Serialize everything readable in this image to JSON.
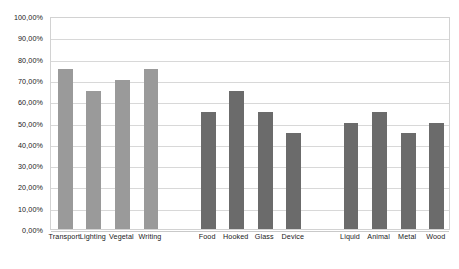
{
  "chart_data": {
    "type": "bar",
    "title": "",
    "subtitle": "",
    "xlabel": "",
    "ylabel": "",
    "ylim": [
      0,
      100
    ],
    "grid": true,
    "legend": "none",
    "y_tick_labels": [
      "100,00%",
      "90,00%",
      "80,00%",
      "70,00%",
      "60,00%",
      "50,00%",
      "40,00%",
      "30,00%",
      "20,00%",
      "10,00%",
      "0,00%"
    ],
    "y_tick_values": [
      100,
      90,
      80,
      70,
      60,
      50,
      40,
      30,
      20,
      10,
      0
    ],
    "categories": [
      "Transport",
      "Lighting",
      "Vegetal",
      "Writing",
      "Food",
      "Hooked",
      "Glass",
      "Device",
      "Liquid",
      "Animal",
      "Metal",
      "Wood"
    ],
    "values": [
      75,
      65,
      70,
      75,
      55,
      65,
      55,
      45,
      50,
      55,
      45,
      50
    ],
    "colors": [
      "#9a9a9a",
      "#9a9a9a",
      "#9a9a9a",
      "#9a9a9a",
      "#6b6b6b",
      "#6b6b6b",
      "#6b6b6b",
      "#6b6b6b",
      "#6b6b6b",
      "#6b6b6b",
      "#6b6b6b",
      "#6b6b6b"
    ],
    "groups": [
      {
        "name": "group-1",
        "color": "#9a9a9a",
        "categories": [
          "Transport",
          "Lighting",
          "Vegetal",
          "Writing"
        ],
        "values": [
          75,
          65,
          70,
          75
        ]
      },
      {
        "name": "group-2",
        "color": "#6b6b6b",
        "categories": [
          "Food",
          "Hooked",
          "Glass",
          "Device"
        ],
        "values": [
          55,
          65,
          55,
          45
        ]
      },
      {
        "name": "group-3",
        "color": "#6b6b6b",
        "categories": [
          "Liquid",
          "Animal",
          "Metal",
          "Wood"
        ],
        "values": [
          50,
          55,
          45,
          50
        ]
      }
    ],
    "slot_indices": [
      0,
      1,
      2,
      3,
      5,
      6,
      7,
      8,
      10,
      11,
      12,
      13
    ],
    "slot_count": 14,
    "gridline_color": "#d8d8d8",
    "plot_border_color": "#d2d2d2",
    "background_color": "#ffffff"
  }
}
